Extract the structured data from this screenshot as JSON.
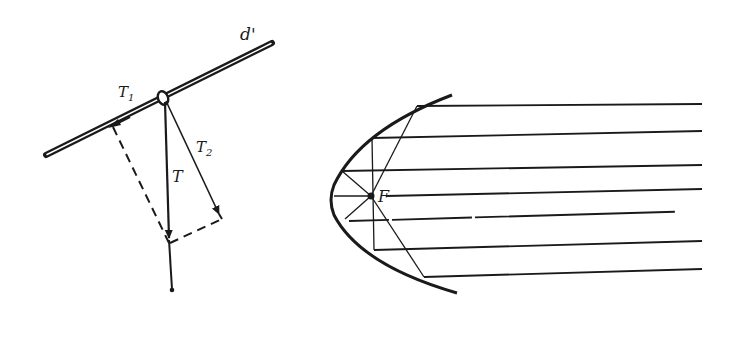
{
  "figures": [
    {
      "id": "force-decomposition",
      "description": "Tension force T at a ring on rod d' decomposed into components T1 (along rod) and T2 (perpendicular)",
      "labels": {
        "rod": "d'",
        "total_force": "T",
        "component_along_rod": "T",
        "component_along_rod_sub": "1",
        "component_perpendicular": "T",
        "component_perpendicular_sub": "2"
      }
    },
    {
      "id": "parabolic-reflector",
      "description": "Parabola with parallel rays reflected through focus F",
      "labels": {
        "focus": "F"
      },
      "ray_count": 7
    }
  ],
  "colors": {
    "ink": "#1a1a1a",
    "background": "#ffffff"
  }
}
